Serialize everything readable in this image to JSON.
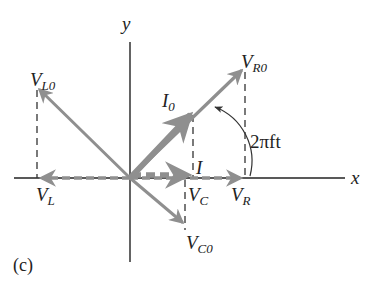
{
  "figure": {
    "panel_label": "(c)",
    "axes": {
      "x_label": "x",
      "y_label": "y"
    },
    "angle_label": "2πft",
    "colors": {
      "axis": "#222222",
      "phasor": "#8f8f8f",
      "dashed": "#333333"
    },
    "phasors": [
      {
        "name": "V_R0",
        "base": "V",
        "sub": "R0",
        "tip": [
          245,
          68
        ]
      },
      {
        "name": "I_0",
        "base": "I",
        "sub": "0",
        "tip": [
          192,
          113
        ]
      },
      {
        "name": "V_L0",
        "base": "V",
        "sub": "L0",
        "tip": [
          37,
          87
        ]
      },
      {
        "name": "V_C0",
        "base": "V",
        "sub": "C0",
        "tip": [
          185,
          225
        ]
      }
    ],
    "projections": [
      {
        "name": "V_R",
        "base": "V",
        "sub": "R"
      },
      {
        "name": "I",
        "base": "I",
        "sub": ""
      },
      {
        "name": "V_L",
        "base": "V",
        "sub": "L"
      },
      {
        "name": "V_C",
        "base": "V",
        "sub": "C"
      }
    ]
  }
}
